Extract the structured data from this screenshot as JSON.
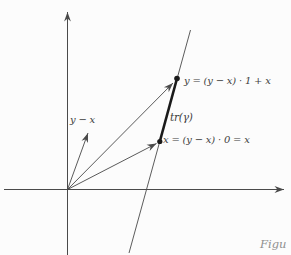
{
  "figure": {
    "labels": {
      "point_y": "y = (y − x) · 1 + x",
      "trace": "tr(γ)",
      "point_x": "x = (y − x) · 0 = x",
      "y_minus_x": "y − x"
    },
    "caption_fragment": "Figu",
    "colors": {
      "background": "#fcfcfc",
      "axis": "#4a4a4a",
      "bold_stroke": "#1a1a1a",
      "label_text": "#3d3d3d",
      "caption_text": "#8f8f8f"
    }
  }
}
